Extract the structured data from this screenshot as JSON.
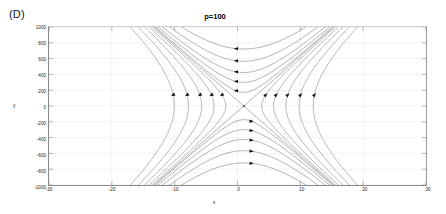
{
  "figure": {
    "panel_label": "(D)",
    "title": "p=100",
    "xlabel": "x",
    "ylabel": "y"
  },
  "chart_data": {
    "type": "line",
    "subtype": "streamline-phase-portrait",
    "title": "p=100",
    "xlabel": "x",
    "ylabel": "y",
    "xlim": [
      -30,
      30
    ],
    "ylim": [
      -1000,
      1000
    ],
    "xticks": [
      -30,
      -20,
      -10,
      0,
      10,
      20,
      30
    ],
    "xtick_labels": [
      "-30",
      "-20",
      "-10",
      "0",
      "10",
      "20",
      "30"
    ],
    "yticks": [
      -1000,
      -800,
      -600,
      -400,
      -200,
      0,
      200,
      400,
      600,
      800,
      1000
    ],
    "ytick_labels": [
      "-1000",
      "-800",
      "-600",
      "-400",
      "-200",
      "0",
      "200",
      "400",
      "600",
      "800",
      "1000"
    ],
    "grid": true,
    "legend": null,
    "fixed_points": [
      {
        "name": "saddle",
        "x": 1.0,
        "y": 0
      }
    ],
    "separatrices": [
      {
        "name": "separatrix-positive-slope",
        "slope": 70,
        "through": [
          1.0,
          0
        ]
      },
      {
        "name": "separatrix-negative-slope",
        "slope": -70,
        "through": [
          1.0,
          0
        ]
      }
    ],
    "streamlines": [
      {
        "branch": "upper",
        "constant": 30000,
        "direction": "leftward"
      },
      {
        "branch": "upper",
        "constant": 90000,
        "direction": "leftward"
      },
      {
        "branch": "upper",
        "constant": 180000,
        "direction": "leftward"
      },
      {
        "branch": "upper",
        "constant": 320000,
        "direction": "leftward"
      },
      {
        "branch": "upper",
        "constant": 520000,
        "direction": "leftward"
      },
      {
        "branch": "lower",
        "constant": 30000,
        "direction": "rightward"
      },
      {
        "branch": "lower",
        "constant": 90000,
        "direction": "rightward"
      },
      {
        "branch": "lower",
        "constant": 180000,
        "direction": "rightward"
      },
      {
        "branch": "lower",
        "constant": 320000,
        "direction": "rightward"
      },
      {
        "branch": "lower",
        "constant": 520000,
        "direction": "rightward"
      },
      {
        "branch": "left",
        "constant": 40000,
        "direction": "downward"
      },
      {
        "branch": "left",
        "constant": 110000,
        "direction": "downward"
      },
      {
        "branch": "left",
        "constant": 220000,
        "direction": "downward"
      },
      {
        "branch": "left",
        "constant": 380000,
        "direction": "downward"
      },
      {
        "branch": "left",
        "constant": 600000,
        "direction": "downward"
      },
      {
        "branch": "right",
        "constant": 40000,
        "direction": "upward"
      },
      {
        "branch": "right",
        "constant": 110000,
        "direction": "upward"
      },
      {
        "branch": "right",
        "constant": 220000,
        "direction": "upward"
      },
      {
        "branch": "right",
        "constant": 380000,
        "direction": "upward"
      },
      {
        "branch": "right",
        "constant": 600000,
        "direction": "upward"
      }
    ],
    "colors": {
      "stream": "#555555",
      "axis": "#8a8a8a",
      "grid": "#e6e6e6",
      "text": "#1a1a1a"
    }
  }
}
